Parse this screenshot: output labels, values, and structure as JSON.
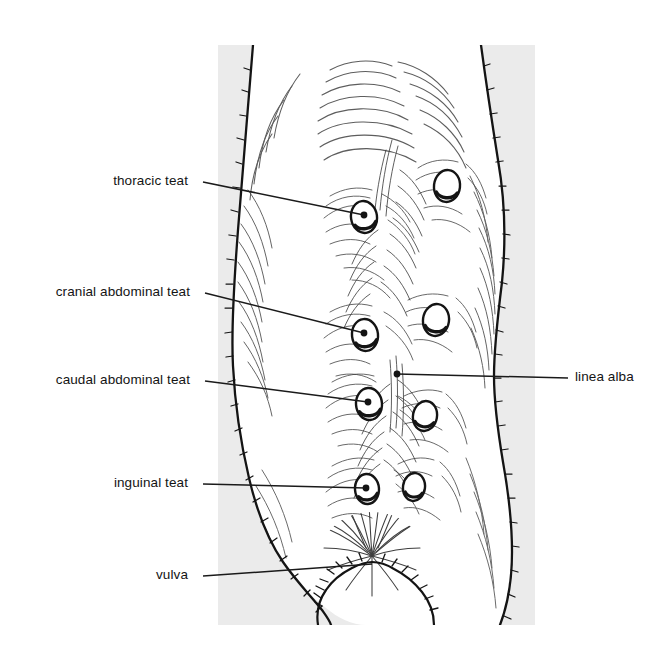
{
  "figure": {
    "background_color": "#ffffff",
    "panel_color": "#ebebeb",
    "ink_color": "#141414",
    "panel": {
      "x": 218,
      "y": 45,
      "width": 317,
      "height": 580
    }
  },
  "labels": {
    "left": [
      {
        "id": "thoracic-teat",
        "text": "thoracic teat",
        "x": 203,
        "y": 182,
        "tip_x": 364,
        "tip_y": 215
      },
      {
        "id": "cranial-abdominal-teat",
        "text": "cranial abdominal teat",
        "x": 205,
        "y": 293,
        "tip_x": 364,
        "tip_y": 333
      },
      {
        "id": "caudal-abdominal-teat",
        "text": "caudal abdominal teat",
        "x": 205,
        "y": 381,
        "tip_x": 368,
        "tip_y": 402
      },
      {
        "id": "inguinal-teat",
        "text": "inguinal teat",
        "x": 203,
        "y": 484,
        "tip_x": 366,
        "tip_y": 488
      },
      {
        "id": "vulva",
        "text": "vulva",
        "x": 203,
        "y": 576,
        "tip_x": 372,
        "tip_y": 564
      }
    ],
    "right": [
      {
        "id": "linea-alba",
        "text": "linea alba",
        "x": 568,
        "y": 378,
        "tip_x": 397,
        "tip_y": 374
      }
    ]
  },
  "teats": [
    {
      "id": "thoracic-left",
      "cx": 364,
      "cy": 217,
      "rx": 13,
      "ry": 16,
      "rot": -8,
      "labelled": true
    },
    {
      "id": "thoracic-right",
      "cx": 447,
      "cy": 186,
      "rx": 13,
      "ry": 16,
      "rot": 6,
      "labelled": false
    },
    {
      "id": "cranial-abdominal-left",
      "cx": 365,
      "cy": 335,
      "rx": 13,
      "ry": 16,
      "rot": -6,
      "labelled": true
    },
    {
      "id": "cranial-abdominal-right",
      "cx": 436,
      "cy": 320,
      "rx": 13,
      "ry": 16,
      "rot": 8,
      "labelled": false
    },
    {
      "id": "caudal-abdominal-left",
      "cx": 369,
      "cy": 404,
      "rx": 13,
      "ry": 16,
      "rot": -4,
      "labelled": true
    },
    {
      "id": "caudal-abdominal-right",
      "cx": 425,
      "cy": 416,
      "rx": 12,
      "ry": 15,
      "rot": 10,
      "labelled": false
    },
    {
      "id": "inguinal-left",
      "cx": 367,
      "cy": 489,
      "rx": 12,
      "ry": 15,
      "rot": -4,
      "labelled": true
    },
    {
      "id": "inguinal-right",
      "cx": 414,
      "cy": 487,
      "rx": 11,
      "ry": 14,
      "rot": 8,
      "labelled": false
    }
  ],
  "anatomy": {
    "linea_alba": {
      "description": "midline raphe running cranio-caudally between the teat rows"
    },
    "vulva": {
      "cx": 372,
      "cy": 558
    },
    "body_outline_left": "narrow cranially, widest at mid abdomen, tapering into the thigh",
    "body_outline_right": "narrow cranially, widest at mid abdomen, tapering into the thigh"
  }
}
